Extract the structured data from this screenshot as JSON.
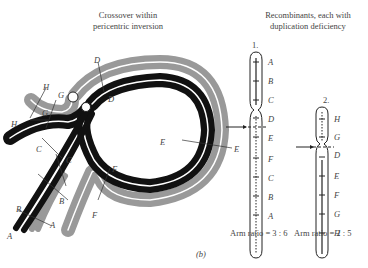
{
  "figure": {
    "panel_label": "(b)",
    "left": {
      "title_line1": "Crossover within",
      "title_line2": "pericentric inversion",
      "gene_labels": [
        "A",
        "B",
        "C",
        "D",
        "E",
        "F",
        "G",
        "H"
      ]
    },
    "right": {
      "title_line1": "Recombinants, each with",
      "title_line2": "duplication deficiency",
      "recombinants": [
        {
          "number": "1.",
          "genes": [
            "A",
            "B",
            "C",
            "D",
            "E",
            "F",
            "C",
            "B",
            "A"
          ],
          "arm_ratio": "Arm ratio = 3 : 6"
        },
        {
          "number": "2.",
          "genes": [
            "H",
            "G",
            "D",
            "E",
            "F",
            "G",
            "H"
          ],
          "arm_ratio": "Arm ratio = 2 : 5"
        }
      ]
    },
    "colors": {
      "dark_chromatid": "#111111",
      "light_chromatid": "#999999"
    }
  }
}
